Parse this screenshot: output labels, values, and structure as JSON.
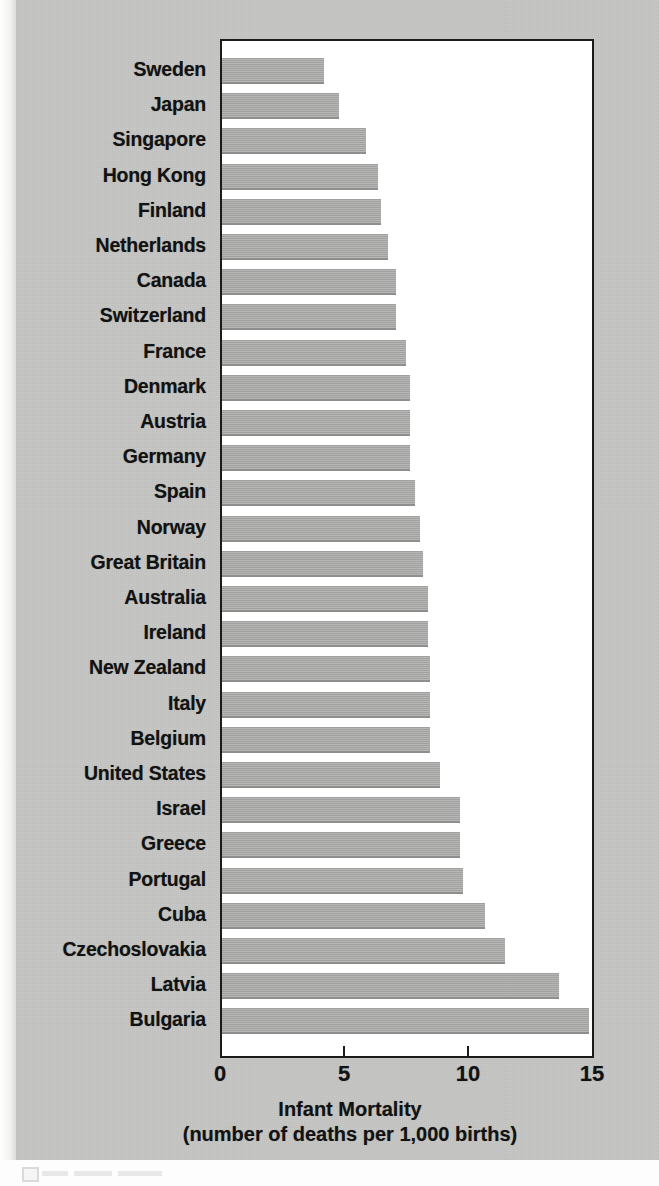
{
  "chart_data": {
    "type": "bar",
    "orientation": "horizontal",
    "title": "",
    "xlabel": "Infant Mortality",
    "xlabel_sub": "(number of deaths per 1,000 births)",
    "ylabel": "",
    "xlim": [
      0,
      15
    ],
    "xticks": [
      "0",
      "5",
      "10",
      "15"
    ],
    "xtick_values": [
      0,
      5,
      10,
      15
    ],
    "grid": false,
    "legend": false,
    "bar_color": "#a9a9a8",
    "background_color": "#c6c6c5",
    "plot_background_color": "#ffffff",
    "axis_color": "#1b1b1b",
    "categories": [
      "Sweden",
      "Japan",
      "Singapore",
      "Hong Kong",
      "Finland",
      "Netherlands",
      "Canada",
      "Switzerland",
      "France",
      "Denmark",
      "Austria",
      "Germany",
      "Spain",
      "Norway",
      "Great Britain",
      "Australia",
      "Ireland",
      "New Zealand",
      "Italy",
      "Belgium",
      "United States",
      "Israel",
      "Greece",
      "Portugal",
      "Cuba",
      "Czechoslovakia",
      "Latvia",
      "Bulgaria"
    ],
    "values": [
      4.1,
      4.7,
      5.8,
      6.3,
      6.4,
      6.7,
      7.0,
      7.0,
      7.4,
      7.6,
      7.6,
      7.6,
      7.8,
      8.0,
      8.1,
      8.3,
      8.3,
      8.4,
      8.4,
      8.4,
      8.8,
      9.6,
      9.6,
      9.7,
      10.6,
      11.4,
      13.6,
      14.8
    ]
  },
  "axis": {
    "title_line1": "Infant Mortality",
    "title_line2": "(number of deaths per 1,000 births)"
  }
}
